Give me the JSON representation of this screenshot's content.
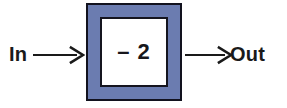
{
  "diagram": {
    "type": "function-machine",
    "input_label": "In",
    "output_label": "Out",
    "rule_text": "– 2",
    "arrow_in_icon": "right-arrow-icon",
    "arrow_out_icon": "right-arrow-icon",
    "colors": {
      "background": "#ffffff",
      "box_fill": "#6b7cb0",
      "box_border": "#12121e",
      "inner_fill": "#ffffff",
      "inner_border": "#15151f",
      "text": "#1a1a1a"
    }
  }
}
